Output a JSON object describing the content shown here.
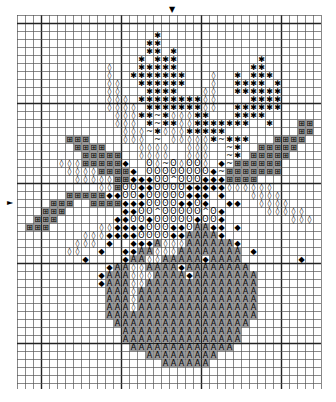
{
  "chart": {
    "cols": 38,
    "rows": 46,
    "cell_px": 8,
    "origin": {
      "x": 17,
      "y": 15
    },
    "thick_every": 10,
    "thick_col_offset": 3,
    "thick_row_offset": 1,
    "center_markers": {
      "top": {
        "symbol": "▼",
        "col": 19
      },
      "left": {
        "symbol": "►",
        "row": 23
      }
    },
    "legend_symbols": {
      "*": {
        "glyph": "✱",
        "name": "star",
        "fill": ""
      },
      "o": {
        "glyph": "◊",
        "name": "diamond-outline",
        "fill": ""
      },
      "~": {
        "glyph": "~",
        "name": "tilde",
        "fill": ""
      },
      "#": {
        "glyph": "⊞",
        "name": "box-grid",
        "fill": "#9a9a9a"
      },
      "O": {
        "glyph": "ʘ",
        "name": "oval-dot",
        "fill": ""
      },
      "d": {
        "glyph": "◆",
        "name": "filled-diamond",
        "fill": ""
      },
      "A": {
        "glyph": "A",
        "name": "letter-a",
        "fill": "#9a9a9a"
      },
      "^": {
        "glyph": "^",
        "name": "caret",
        "fill": ""
      }
    },
    "pattern": [
      "......................................",
      "......................................",
      ".................*....................",
      "................**....................",
      "................**.*..................",
      "...............*.***..........*.......",
      "...........o...*****.........**.......",
      "...........o..*******...o..*.***......",
      "...........oo..******...o..****.*.....",
      "...........oo...****...oo..******.....",
      "...........ooo.********oo....****.....",
      "...........oooo.*******oo..******.....",
      "............ooo**~*ooo**...****.......",
      "............ooo.*~**oo*******..*...##.",
      ".............ooo~*ooo*****.........##.",
      "......###....ooo.~.ooooo*~***...####..",
      ".......####....oooo..ooo..~*..#####...",
      "........#####..oooo..ooo..~*.#####....",
      ".....ooo#####d..Oo~OoOOo.d~######.....",
      "......oooo####d.OOOOOOOOd~#######.....",
      ".......ooooo##dddOO^OOOddd####........",
      "..........oo#OOddOOOOdddddoooooo......",
      "......#####ddOOdOOOOOddd.d...oooo.....",
      "....###..####dddOOOOddOd..dd..oooo....",
      "...###.......ddOO^OOOOO^Od.....ooooo..",
      "..###.......ddOOdOOOOOdOOd........ooo.",
      ".###......ooddddOOOddOAAdd.d..........",
      "........oooddddOOOOddAAAAd............",
      ".......ooo.d..dddAoooAAAAAAd..........",
      "......oo..d..ddAAoooAAAAAAAA.d........",
      "........d....dAAooAAAAAdAAAA.......d..",
      "...........dAAooAAAAdAAAAAAAA.........",
      "..........dAAAoooAAAAdAAAAAAAA........",
      "..........dAAAooAAAAAAAAAAAAAA........",
      "...........AAAoAAAAAAAAAAAAAAA........",
      "...........AAAoAAAAAAAAAAAAAAA........",
      "...........AAAoAAAAAAAAAAAAAAA........",
      "...........AAAAAAAAAAAAAAAAAAA........",
      "............AAAAAAAAAAAAAAAAA.........",
      ".............AAAAAAAAAAAAAAA..........",
      ".............AAAAAAAAAAAAAAA..........",
      "..............AAAAAAAAAAAAA...........",
      "................AAAAAAAAA.............",
      "..................AAAAAA..............",
      "......................................",
      "......................................"
    ]
  }
}
